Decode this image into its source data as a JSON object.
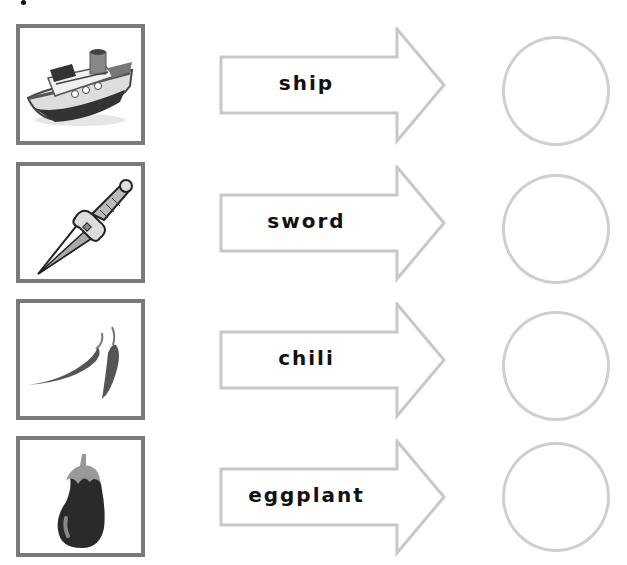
{
  "worksheet": {
    "rows": [
      {
        "picture": "ship-illustration",
        "word": "ship"
      },
      {
        "picture": "sword-illustration",
        "word": "sword"
      },
      {
        "picture": "chili-illustration",
        "word": "chili"
      },
      {
        "picture": "eggplant-illustration",
        "word": "eggplant"
      }
    ]
  },
  "colors": {
    "frame": "#7a7a7a",
    "arrow_outline": "#c8c8c8",
    "circle_outline": "#cfcfcf",
    "text": "#111111"
  }
}
